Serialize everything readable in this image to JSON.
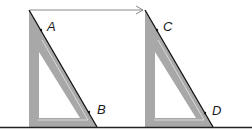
{
  "diagram": {
    "colors": {
      "background": "#ffffff",
      "set_square_fill": "#a8a8a8",
      "set_square_inner_line": "#e6e6e6",
      "edge_line": "#111111",
      "ruler_line": "#222222",
      "arrow": "#888888"
    },
    "points": [
      {
        "label": "A",
        "x": 47,
        "y": 32
      },
      {
        "label": "B",
        "x": 97,
        "y": 110
      },
      {
        "label": "C",
        "x": 163,
        "y": 32
      },
      {
        "label": "D",
        "x": 213,
        "y": 112
      }
    ],
    "set_squares": [
      {
        "name": "first-position",
        "top_x": 29,
        "bottom_left_x": 29,
        "bottom_right_x": 97
      },
      {
        "name": "second-position",
        "top_x": 145,
        "bottom_left_x": 145,
        "bottom_right_x": 213
      }
    ],
    "arrow": {
      "from_x": 30,
      "to_x": 145,
      "y": 10
    }
  }
}
